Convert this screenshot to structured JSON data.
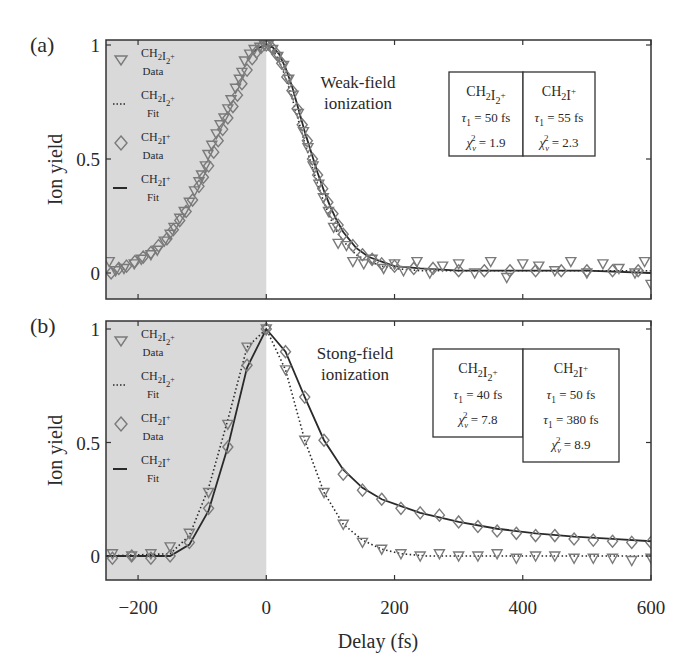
{
  "chart_data": [
    {
      "panel": "(a)",
      "type": "scatter",
      "title": "Weak-field ionization",
      "annotation_lines": [
        "Weak-field",
        "ionization"
      ],
      "xlabel": "Delay (fs)",
      "ylabel": "Ion yield",
      "xlim": [
        -250,
        600
      ],
      "ylim": [
        -0.08,
        1.03
      ],
      "xticks": [
        -200,
        0,
        200,
        400,
        600
      ],
      "yticks": [
        0,
        0.5,
        1
      ],
      "ytick_labels": [
        "0",
        "0.5",
        "1"
      ],
      "shaded_region": {
        "x0": -250,
        "x1": 0,
        "color": "#d9d9d9"
      },
      "legend": [
        {
          "marker": "triangle-down",
          "label": "CH2I2+",
          "sub": "Data"
        },
        {
          "marker": "dotted-line",
          "label": "CH2I2+",
          "sub": "Fit"
        },
        {
          "marker": "diamond",
          "label": "CH2I+",
          "sub": "Data"
        },
        {
          "marker": "solid-line",
          "label": "CH2I+",
          "sub": "Fit"
        }
      ],
      "fit_table": [
        {
          "species": "CH2I2+",
          "rows": [
            "τ1 = 50 fs",
            "χν² = 1.9"
          ]
        },
        {
          "species": "CH2I+",
          "rows": [
            "τ1 = 55 fs",
            "χν² = 2.3"
          ]
        }
      ],
      "series": [
        {
          "name": "CH2I2+ Data",
          "style": "triangle",
          "x": [
            -245,
            -235,
            -222,
            -206,
            -195,
            -180,
            -170,
            -159,
            -150,
            -144,
            -135,
            -128,
            -120,
            -112,
            -105,
            -101,
            -95,
            -91,
            -85,
            -78,
            -72,
            -66,
            -60,
            -55,
            -48,
            -42,
            -38,
            -34,
            -26,
            -19,
            -10,
            -3,
            3,
            10,
            18,
            27,
            35,
            42,
            50,
            58,
            65,
            73,
            82,
            89,
            97,
            105,
            112,
            125,
            135,
            152,
            165,
            183,
            200,
            214,
            235,
            255,
            275,
            300,
            325,
            350,
            375,
            400,
            425,
            450,
            475,
            500,
            525,
            550,
            575,
            590,
            600
          ],
          "y": [
            0.05,
            0.01,
            0.02,
            0.04,
            0.06,
            0.08,
            0.1,
            0.14,
            0.17,
            0.2,
            0.24,
            0.27,
            0.31,
            0.36,
            0.4,
            0.43,
            0.47,
            0.52,
            0.56,
            0.61,
            0.65,
            0.68,
            0.72,
            0.76,
            0.81,
            0.85,
            0.88,
            0.93,
            0.96,
            0.98,
            0.99,
            1.0,
            1.0,
            0.98,
            0.95,
            0.91,
            0.85,
            0.78,
            0.7,
            0.62,
            0.55,
            0.47,
            0.39,
            0.33,
            0.27,
            0.2,
            0.13,
            0.12,
            0.05,
            0.04,
            0.06,
            0.02,
            0.04,
            0.01,
            0.05,
            0.0,
            0.03,
            0.04,
            0.0,
            0.05,
            -0.02,
            0.04,
            0.03,
            0.01,
            0.05,
            0.0,
            0.04,
            0.02,
            0.0,
            0.05,
            -0.05
          ]
        },
        {
          "name": "CH2I+ Data",
          "style": "diamond",
          "x": [
            -242,
            -230,
            -218,
            -205,
            -192,
            -180,
            -168,
            -155,
            -145,
            -135,
            -125,
            -115,
            -105,
            -98,
            -90,
            -82,
            -75,
            -68,
            -60,
            -52,
            -45,
            -38,
            -30,
            -22,
            -15,
            -8,
            0,
            8,
            16,
            24,
            32,
            40,
            48,
            56,
            64,
            72,
            80,
            88,
            96,
            104,
            112,
            120,
            135,
            150,
            165,
            180,
            200,
            230,
            260,
            300,
            340,
            380,
            420,
            460,
            500,
            540,
            580
          ],
          "y": [
            0.0,
            0.02,
            0.03,
            0.05,
            0.07,
            0.09,
            0.12,
            0.15,
            0.19,
            0.23,
            0.27,
            0.32,
            0.38,
            0.42,
            0.47,
            0.53,
            0.58,
            0.63,
            0.68,
            0.73,
            0.78,
            0.83,
            0.89,
            0.94,
            0.97,
            0.99,
            1.0,
            0.99,
            0.96,
            0.92,
            0.86,
            0.8,
            0.72,
            0.65,
            0.58,
            0.5,
            0.43,
            0.37,
            0.31,
            0.26,
            0.21,
            0.17,
            0.12,
            0.08,
            0.06,
            0.04,
            0.03,
            0.02,
            0.02,
            0.01,
            0.01,
            0.01,
            0.01,
            0.01,
            0.01,
            0.01,
            0.01
          ]
        },
        {
          "name": "CH2I2+ Fit",
          "style": "dotted",
          "x": [
            0,
            10,
            20,
            30,
            40,
            50,
            60,
            70,
            80,
            90,
            100,
            110,
            120,
            140,
            160,
            180,
            200,
            240,
            300,
            400,
            500,
            600
          ],
          "y": [
            1.0,
            0.98,
            0.93,
            0.86,
            0.77,
            0.67,
            0.57,
            0.48,
            0.39,
            0.31,
            0.24,
            0.18,
            0.14,
            0.08,
            0.05,
            0.03,
            0.02,
            0.01,
            0.01,
            0.01,
            0.01,
            0.01
          ]
        },
        {
          "name": "CH2I+ Fit",
          "style": "solid",
          "x": [
            -20,
            -10,
            0,
            10,
            20,
            30,
            40,
            50,
            60,
            70,
            80,
            90,
            100,
            110,
            120,
            140,
            160,
            180,
            200,
            240,
            300,
            400,
            500,
            600
          ],
          "y": [
            0.97,
            0.99,
            1.0,
            0.99,
            0.96,
            0.9,
            0.82,
            0.72,
            0.62,
            0.53,
            0.44,
            0.36,
            0.29,
            0.23,
            0.18,
            0.11,
            0.07,
            0.05,
            0.03,
            0.02,
            0.01,
            0.01,
            0.01,
            0.0
          ]
        }
      ]
    },
    {
      "panel": "(b)",
      "type": "scatter",
      "title": "Stong-field ionization",
      "annotation_lines": [
        "Stong-field",
        "ionization"
      ],
      "xlabel": "Delay (fs)",
      "ylabel": "Ion yield",
      "xlim": [
        -250,
        600
      ],
      "ylim": [
        -0.1,
        1.03
      ],
      "xticks": [
        -200,
        0,
        200,
        400,
        600
      ],
      "xtick_labels": [
        "−200",
        "0",
        "200",
        "400",
        "600"
      ],
      "yticks": [
        0,
        0.5,
        1
      ],
      "ytick_labels": [
        "0",
        "0.5",
        "1"
      ],
      "shaded_region": {
        "x0": -250,
        "x1": 0,
        "color": "#d9d9d9"
      },
      "legend": [
        {
          "marker": "triangle-down",
          "label": "CH2I2+",
          "sub": "Data"
        },
        {
          "marker": "dotted-line",
          "label": "CH2I2+",
          "sub": "Fit"
        },
        {
          "marker": "diamond",
          "label": "CH2I+",
          "sub": "Data"
        },
        {
          "marker": "solid-line",
          "label": "CH2I+",
          "sub": "Fit"
        }
      ],
      "fit_table": [
        {
          "species": "CH2I2+",
          "rows": [
            "τ1 = 40 fs",
            "χν² = 7.8"
          ]
        },
        {
          "species": "CH2I+",
          "rows": [
            "τ1 = 50 fs",
            "τ1 = 380 fs",
            "χν² = 8.9"
          ]
        }
      ],
      "series": [
        {
          "name": "CH2I2+ Data",
          "style": "triangle",
          "x": [
            -240,
            -210,
            -180,
            -150,
            -120,
            -90,
            -60,
            -30,
            0,
            30,
            60,
            90,
            120,
            150,
            180,
            210,
            240,
            270,
            300,
            330,
            360,
            390,
            420,
            450,
            480,
            510,
            540,
            570,
            600
          ],
          "y": [
            0.01,
            0.0,
            0.01,
            0.04,
            0.1,
            0.28,
            0.58,
            0.92,
            1.0,
            0.82,
            0.51,
            0.28,
            0.14,
            0.06,
            0.03,
            0.01,
            0.0,
            0.01,
            0.0,
            0.0,
            0.01,
            -0.01,
            0.0,
            0.0,
            -0.01,
            -0.01,
            -0.01,
            -0.02,
            -0.01
          ]
        },
        {
          "name": "CH2I+ Data",
          "style": "diamond",
          "x": [
            -240,
            -210,
            -180,
            -150,
            -120,
            -90,
            -60,
            -30,
            0,
            30,
            60,
            90,
            120,
            150,
            180,
            210,
            240,
            270,
            300,
            330,
            360,
            390,
            420,
            450,
            480,
            510,
            540,
            570,
            600
          ],
          "y": [
            -0.01,
            0.0,
            -0.01,
            0.0,
            0.06,
            0.21,
            0.48,
            0.84,
            1.0,
            0.9,
            0.7,
            0.51,
            0.36,
            0.29,
            0.25,
            0.21,
            0.19,
            0.18,
            0.15,
            0.13,
            0.11,
            0.1,
            0.09,
            0.09,
            0.075,
            0.07,
            0.065,
            0.06,
            0.06
          ]
        },
        {
          "name": "CH2I2+ Fit",
          "style": "dotted",
          "x": [
            -250,
            -150,
            -120,
            -90,
            -60,
            -30,
            0,
            30,
            60,
            90,
            120,
            150,
            180,
            210,
            250,
            300,
            400,
            500,
            600
          ],
          "y": [
            0.0,
            0.01,
            0.09,
            0.3,
            0.6,
            0.92,
            1.0,
            0.82,
            0.51,
            0.28,
            0.14,
            0.07,
            0.03,
            0.01,
            0.0,
            0.0,
            0.0,
            0.0,
            0.0
          ]
        },
        {
          "name": "CH2I+ Fit",
          "style": "solid",
          "x": [
            -250,
            -150,
            -120,
            -90,
            -60,
            -30,
            0,
            30,
            60,
            90,
            120,
            150,
            180,
            210,
            240,
            270,
            300,
            360,
            420,
            480,
            540,
            600
          ],
          "y": [
            0.0,
            0.0,
            0.05,
            0.2,
            0.48,
            0.83,
            1.0,
            0.9,
            0.7,
            0.51,
            0.38,
            0.3,
            0.25,
            0.22,
            0.19,
            0.17,
            0.15,
            0.12,
            0.1,
            0.085,
            0.075,
            0.065
          ]
        }
      ]
    }
  ],
  "panels": [
    {
      "label": "(a)",
      "ylabel": "Ion yield"
    },
    {
      "label": "(b)",
      "ylabel": "Ion yield"
    }
  ],
  "xaxis": {
    "label": "Delay (fs)",
    "tick_labels": [
      "−200",
      "0",
      "200",
      "400",
      "600"
    ]
  },
  "colors": {
    "shade": "#d9d9d9",
    "marker": "#7a7a7a",
    "line": "#2a2a2a",
    "axis": "#333333"
  }
}
